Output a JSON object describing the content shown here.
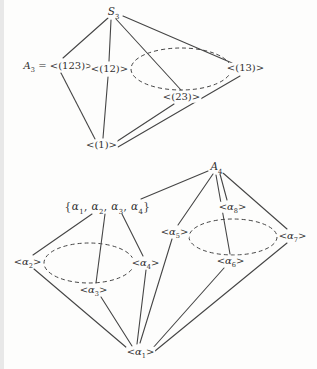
{
  "figure": {
    "background": "#fdfdfc",
    "ink_color": "#454545",
    "width": 313,
    "height": 369,
    "diagrams": [
      {
        "name": "s3-subgroup-lattice",
        "nodes": [
          {
            "id": "s3",
            "label": "*S*_{3}",
            "x": 110,
            "y": 12
          },
          {
            "id": "a3-123",
            "label": "*A*_{3} = <(123)>",
            "x": 55,
            "y": 66
          },
          {
            "id": "gen-12",
            "label": "<(12)>",
            "x": 106,
            "y": 69
          },
          {
            "id": "gen-13",
            "label": "<(13)>",
            "x": 242,
            "y": 68
          },
          {
            "id": "gen-23",
            "label": "<(23)>",
            "x": 178,
            "y": 97
          },
          {
            "id": "gen-1",
            "label": "<(1)>",
            "x": 98,
            "y": 145
          }
        ],
        "edges": [
          {
            "from": "s3",
            "to": "a3-123",
            "x1": 104,
            "y1": 18,
            "x2": 59,
            "y2": 58
          },
          {
            "from": "s3",
            "to": "gen-12",
            "x1": 107,
            "y1": 20,
            "x2": 105,
            "y2": 61
          },
          {
            "from": "s3",
            "to": "gen-23",
            "x1": 112,
            "y1": 19,
            "x2": 177,
            "y2": 90
          },
          {
            "from": "s3",
            "to": "gen-13",
            "x1": 119,
            "y1": 16,
            "x2": 228,
            "y2": 63
          },
          {
            "from": "a3-123",
            "to": "gen-1",
            "x1": 57,
            "y1": 73,
            "x2": 91,
            "y2": 139
          },
          {
            "from": "gen-12",
            "to": "gen-1",
            "x1": 104,
            "y1": 77,
            "x2": 99,
            "y2": 138
          },
          {
            "from": "gen-23",
            "to": "gen-1",
            "x1": 170,
            "y1": 104,
            "x2": 112,
            "y2": 142
          },
          {
            "from": "gen-13",
            "to": "gen-1",
            "x1": 236,
            "y1": 76,
            "x2": 114,
            "y2": 147
          }
        ],
        "ellipses": [
          {
            "name": "transpositions-conjugacy-class",
            "cx": 177,
            "cy": 69,
            "rx": 50,
            "ry": 21
          }
        ]
      },
      {
        "name": "a4-subgroup-lattice",
        "nodes": [
          {
            "id": "a4",
            "label": "*A*_{4}",
            "x": 213,
            "y": 167
          },
          {
            "id": "v4",
            "label": "{*α*_{1}, *α*_{2}, *α*_{3}, *α*_{4}}",
            "x": 104,
            "y": 207
          },
          {
            "id": "gen-alpha5",
            "label": "<*α*_{5}>",
            "x": 171,
            "y": 232
          },
          {
            "id": "gen-alpha8",
            "label": "<*α*_{8}>",
            "x": 229,
            "y": 207
          },
          {
            "id": "gen-alpha7",
            "label": "<*α*_{7}>",
            "x": 289,
            "y": 236
          },
          {
            "id": "gen-alpha6",
            "label": "<*α*_{6}>",
            "x": 227,
            "y": 261
          },
          {
            "id": "gen-alpha2",
            "label": "<*α*_{2}>",
            "x": 24,
            "y": 262
          },
          {
            "id": "gen-alpha4",
            "label": "<*α*_{4}>",
            "x": 142,
            "y": 263
          },
          {
            "id": "gen-alpha3",
            "label": "<*α*_{3}>",
            "x": 90,
            "y": 290
          },
          {
            "id": "gen-alpha1",
            "label": "<*α*_{1}>",
            "x": 137,
            "y": 352
          }
        ],
        "edges": [
          {
            "from": "a4",
            "to": "v4",
            "x1": 204,
            "y1": 171,
            "x2": 137,
            "y2": 199
          },
          {
            "from": "a4",
            "to": "gen-alpha5",
            "x1": 209,
            "y1": 174,
            "x2": 174,
            "y2": 225
          },
          {
            "from": "a4",
            "to": "gen-alpha6",
            "x1": 212,
            "y1": 175,
            "x2": 226,
            "y2": 254
          },
          {
            "from": "a4",
            "to": "gen-alpha8",
            "x1": 216,
            "y1": 174,
            "x2": 223,
            "y2": 200
          },
          {
            "from": "a4",
            "to": "gen-alpha7",
            "x1": 219,
            "y1": 173,
            "x2": 283,
            "y2": 229
          },
          {
            "from": "v4",
            "to": "gen-alpha2",
            "x1": 88,
            "y1": 214,
            "x2": 29,
            "y2": 255
          },
          {
            "from": "v4",
            "to": "gen-alpha3",
            "x1": 101,
            "y1": 214,
            "x2": 92,
            "y2": 283
          },
          {
            "from": "v4",
            "to": "gen-alpha4",
            "x1": 118,
            "y1": 214,
            "x2": 139,
            "y2": 256
          },
          {
            "from": "gen-alpha2",
            "to": "gen-alpha1",
            "x1": 30,
            "y1": 269,
            "x2": 123,
            "y2": 348
          },
          {
            "from": "gen-alpha3",
            "to": "gen-alpha1",
            "x1": 97,
            "y1": 297,
            "x2": 128,
            "y2": 346
          },
          {
            "from": "gen-alpha4",
            "to": "gen-alpha1",
            "x1": 142,
            "y1": 270,
            "x2": 133,
            "y2": 344
          },
          {
            "from": "gen-alpha5",
            "to": "gen-alpha1",
            "x1": 168,
            "y1": 239,
            "x2": 136,
            "y2": 343
          },
          {
            "from": "gen-alpha6",
            "to": "gen-alpha1",
            "x1": 220,
            "y1": 268,
            "x2": 148,
            "y2": 349
          },
          {
            "from": "gen-alpha7",
            "to": "gen-alpha1",
            "x1": 283,
            "y1": 243,
            "x2": 151,
            "y2": 351
          }
        ],
        "ellipses": [
          {
            "name": "order2-conjugacy-class",
            "cx": 85,
            "cy": 263,
            "rx": 45,
            "ry": 20
          },
          {
            "name": "order3-conjugacy-class",
            "cx": 229,
            "cy": 237,
            "rx": 44,
            "ry": 18
          }
        ]
      }
    ]
  }
}
